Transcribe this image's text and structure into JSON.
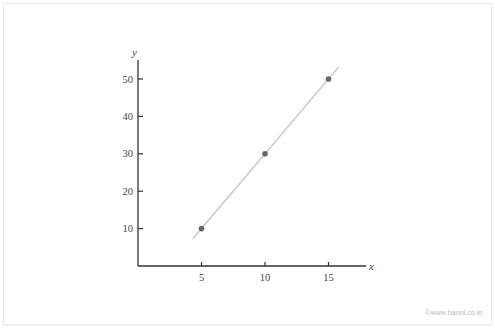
{
  "chart_data": {
    "type": "scatter",
    "title": "",
    "xlabel": "x",
    "ylabel": "y",
    "xlim": [
      0,
      18
    ],
    "ylim": [
      0,
      55
    ],
    "x_ticks": [
      5,
      10,
      15
    ],
    "y_ticks": [
      10,
      20,
      30,
      40,
      50
    ],
    "grid": false,
    "legend": null,
    "series": [
      {
        "name": "points",
        "x": [
          5,
          10,
          15
        ],
        "y": [
          10,
          30,
          50
        ],
        "color": "#666666"
      }
    ],
    "fit_line": {
      "equation": "y = 4x - 10",
      "x_start": 4.3,
      "x_end": 15.8,
      "color": "#c8c8c8"
    }
  },
  "watermark": "©www.hanol.co.kr"
}
